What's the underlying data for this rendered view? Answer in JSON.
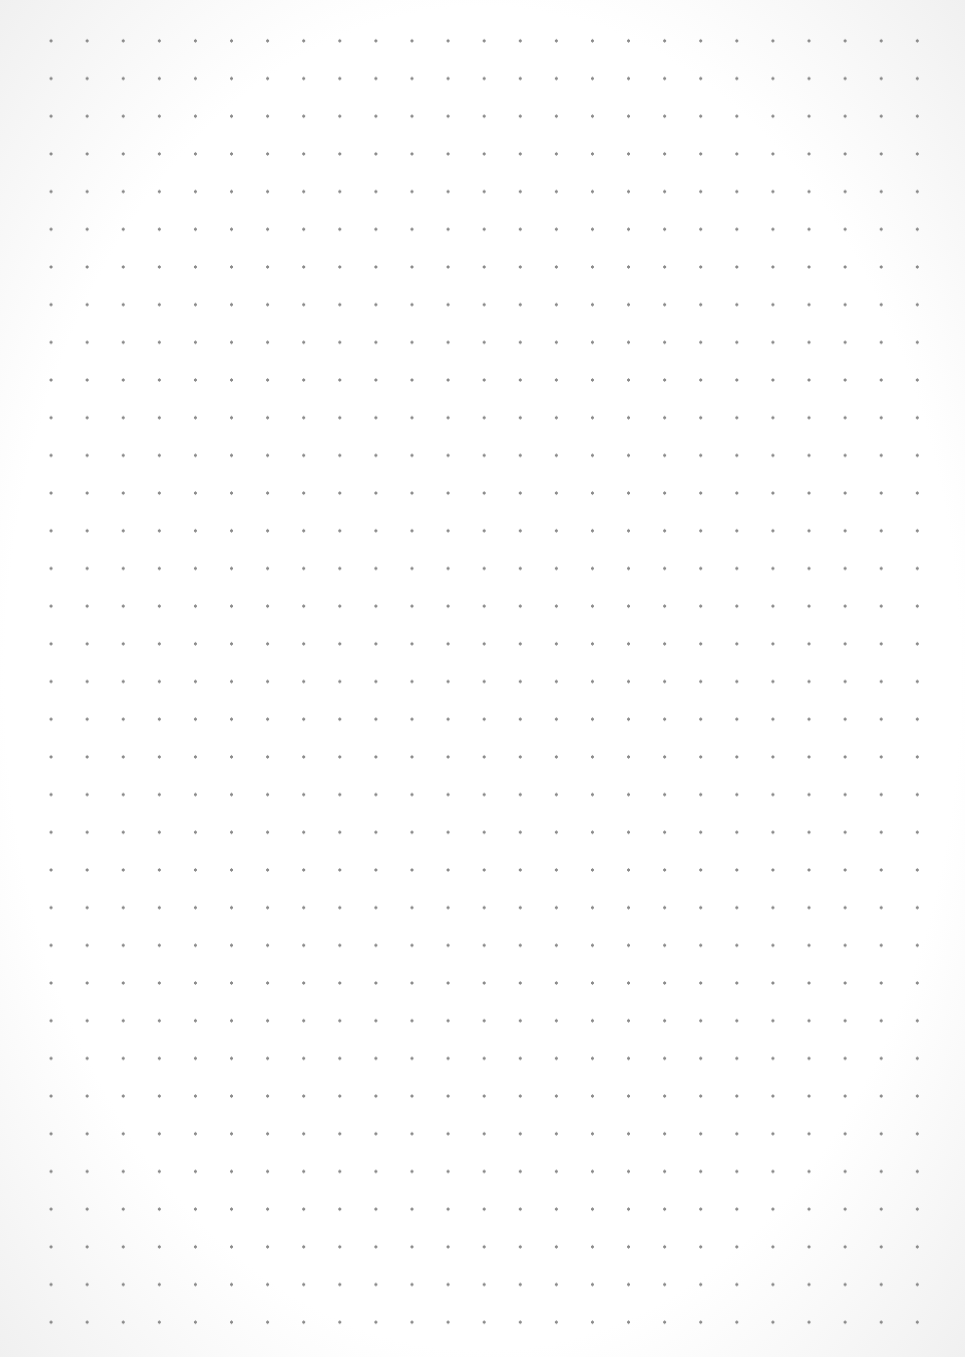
{
  "page": {
    "type": "dot-grid paper",
    "dot_color": "#8a8a8a",
    "background_color": "#ffffff",
    "columns": 26,
    "rows": 36
  }
}
